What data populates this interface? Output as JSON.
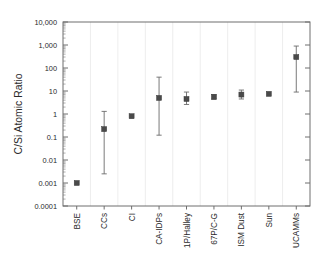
{
  "chart_data": {
    "type": "scatter",
    "title": "",
    "subtitle": "",
    "xlabel": "",
    "ylabel": "C/Si Atomic Ratio",
    "yscale": "log",
    "ylim": [
      0.0001,
      10000
    ],
    "grid": false,
    "legend": false,
    "marker_color": "#4a4a4a",
    "errorbar_color": "#6b6b6b",
    "axis_color": "#6e6e6e",
    "ytick_labels": [
      "10,000",
      "1,000",
      "100",
      "10",
      "1",
      "0.1",
      "0.01",
      "0.001",
      "0.0001"
    ],
    "ytick_values": [
      10000,
      1000,
      100,
      10,
      1,
      0.1,
      0.01,
      0.001,
      0.0001
    ],
    "categories": [
      "BSE",
      "CCs",
      "CI",
      "CA-IDPs",
      "1P/Halley",
      "67P/C-G",
      "ISM Dust",
      "Sun",
      "UCAMMs"
    ],
    "values": [
      0.001,
      0.22,
      0.8,
      5.0,
      4.5,
      5.5,
      7.0,
      7.5,
      300
    ],
    "err_low": [
      null,
      0.0025,
      null,
      0.12,
      2.6,
      4.5,
      4.5,
      null,
      9
    ],
    "err_high": [
      null,
      1.3,
      null,
      40,
      9.0,
      7.0,
      11.0,
      null,
      900
    ],
    "points": [
      {
        "category": "BSE",
        "value": 0.001,
        "err_low": null,
        "err_high": null
      },
      {
        "category": "CCs",
        "value": 0.22,
        "err_low": 0.0025,
        "err_high": 1.3
      },
      {
        "category": "CI",
        "value": 0.8,
        "err_low": null,
        "err_high": null
      },
      {
        "category": "CA-IDPs",
        "value": 5.0,
        "err_low": 0.12,
        "err_high": 40
      },
      {
        "category": "1P/Halley",
        "value": 4.5,
        "err_low": 2.6,
        "err_high": 9.0
      },
      {
        "category": "67P/C-G",
        "value": 5.5,
        "err_low": 4.5,
        "err_high": 7.0
      },
      {
        "category": "ISM Dust",
        "value": 7.0,
        "err_low": 4.5,
        "err_high": 11.0
      },
      {
        "category": "Sun",
        "value": 7.5,
        "err_low": null,
        "err_high": null
      },
      {
        "category": "UCAMMs",
        "value": 300,
        "err_low": 9,
        "err_high": 900
      }
    ]
  }
}
